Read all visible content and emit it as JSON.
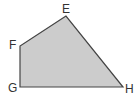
{
  "figure": {
    "shape": "quadrilateral",
    "fill": "#cccccc",
    "stroke": "#444444",
    "vertices": [
      {
        "label": "E",
        "x": 66,
        "y": 16,
        "lx": 62,
        "ly": 13
      },
      {
        "label": "F",
        "x": 20,
        "y": 46,
        "lx": 9,
        "ly": 49
      },
      {
        "label": "G",
        "x": 20,
        "y": 87,
        "lx": 8,
        "ly": 92
      },
      {
        "label": "H",
        "x": 123,
        "y": 87,
        "lx": 125,
        "ly": 93
      }
    ]
  }
}
